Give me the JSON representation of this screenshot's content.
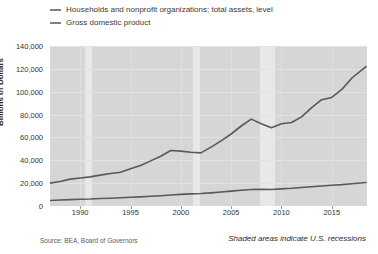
{
  "legend": {
    "items": [
      {
        "label": "Households and nonprofit organizations; total assets, level",
        "color": "#808080"
      },
      {
        "label": "Gross domestic product",
        "color": "#808080"
      }
    ]
  },
  "footer": {
    "source": "Source: BEA, Board of Governors",
    "note": "Shaded areas indicate U.S. recessions"
  },
  "colors": {
    "plot_background": "#d6d6d6",
    "recession_band": "#e8e8e8",
    "line": "#595959",
    "page_background": "#ffffff"
  },
  "chart_data": {
    "type": "line",
    "title": "",
    "xlabel": "",
    "ylabel": "Billions of Dollars",
    "ylim": [
      0,
      140000
    ],
    "yticks": [
      0,
      20000,
      40000,
      60000,
      80000,
      100000,
      120000,
      140000
    ],
    "ytick_labels": [
      "0",
      "20,000",
      "40,000",
      "60,000",
      "80,000",
      "100,000",
      "120,000",
      "140,000"
    ],
    "xlim": [
      1987,
      2018.5
    ],
    "xticks": [
      1990,
      1995,
      2000,
      2005,
      2010,
      2015
    ],
    "xtick_labels": [
      "1990",
      "1995",
      "2000",
      "2005",
      "2010",
      "2015"
    ],
    "grid": true,
    "legend_position": "above-plot",
    "annotations": [
      "Shaded areas indicate U.S. recessions"
    ],
    "recessions": [
      {
        "start": 1990.5,
        "end": 1991.2
      },
      {
        "start": 2001.2,
        "end": 2001.9
      },
      {
        "start": 2007.9,
        "end": 2009.4
      }
    ],
    "series": [
      {
        "name": "Households and nonprofit organizations; total assets, level",
        "color": "#595959",
        "x": [
          1987,
          1988,
          1989,
          1990,
          1991,
          1992,
          1993,
          1994,
          1995,
          1996,
          1997,
          1998,
          1999,
          2000,
          2001,
          2002,
          2003,
          2004,
          2005,
          2006,
          2007,
          2008,
          2009,
          2010,
          2011,
          2012,
          2013,
          2014,
          2015,
          2016,
          2017,
          2018.4
        ],
        "values": [
          20000,
          21500,
          23500,
          24500,
          25500,
          27000,
          28500,
          29500,
          32500,
          35500,
          39500,
          43500,
          48500,
          48000,
          47000,
          46500,
          51500,
          57000,
          63000,
          70000,
          76000,
          72000,
          68500,
          72000,
          73000,
          78000,
          86000,
          93000,
          95000,
          102000,
          112000,
          122000
        ]
      },
      {
        "name": "Gross domestic product",
        "color": "#595959",
        "x": [
          1987,
          1988,
          1989,
          1990,
          1991,
          1992,
          1993,
          1994,
          1995,
          1996,
          1997,
          1998,
          1999,
          2000,
          2001,
          2002,
          2003,
          2004,
          2005,
          2006,
          2007,
          2008,
          2009,
          2010,
          2011,
          2012,
          2013,
          2014,
          2015,
          2016,
          2017,
          2018.4
        ],
        "values": [
          4800,
          5200,
          5600,
          5900,
          6100,
          6500,
          6800,
          7200,
          7600,
          8000,
          8500,
          9000,
          9600,
          10200,
          10600,
          10900,
          11500,
          12200,
          13000,
          13800,
          14400,
          14700,
          14400,
          15000,
          15500,
          16200,
          16800,
          17500,
          18200,
          18700,
          19500,
          20500
        ]
      }
    ]
  }
}
